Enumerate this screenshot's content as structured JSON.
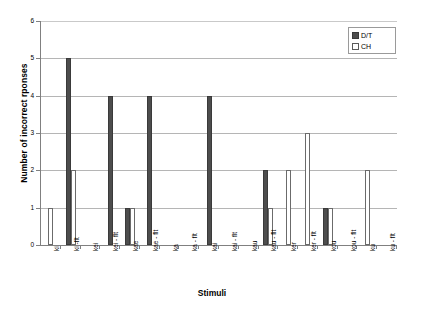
{
  "chart_data": {
    "type": "bar",
    "title": "",
    "xlabel": "Stimuli",
    "ylabel": "Number of incorrect rponses",
    "ylim": [
      0,
      6
    ],
    "ytick_labels": [
      "0",
      "1",
      "2",
      "3",
      "4",
      "5",
      "6"
    ],
    "grid": true,
    "legend_position": "top-right",
    "categories": [
      "ki",
      "ki -flt",
      "kei",
      "kei - flt",
      "kae",
      "kae - flt",
      "ka",
      "ka - flt",
      "kai",
      "kai - flt",
      "kau",
      "kau - flt",
      "ker",
      "ker - flt",
      "kou",
      "kou - flt",
      "ku",
      "ku - flt"
    ],
    "series": [
      {
        "name": "D/T",
        "color": "#4d4d4d",
        "values": [
          0,
          5,
          0,
          4,
          1,
          4,
          0,
          0,
          4,
          0,
          0,
          2,
          0,
          0,
          1,
          0,
          0,
          0
        ]
      },
      {
        "name": "CH",
        "color": "#ffffff",
        "values": [
          1,
          2,
          0,
          0,
          1,
          0,
          0,
          0,
          0,
          0,
          0,
          1,
          2,
          3,
          1,
          0,
          2,
          0
        ]
      }
    ]
  },
  "legend": {
    "items": [
      {
        "label": "D/T",
        "swatch": "filled-dark-square"
      },
      {
        "label": "CH",
        "swatch": "empty-white-square"
      }
    ]
  }
}
